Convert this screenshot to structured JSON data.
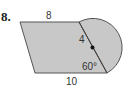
{
  "problem": {
    "number": "8.",
    "labels": {
      "top_side": "8",
      "bottom_side": "10",
      "radius": "4",
      "angle": "60°"
    }
  },
  "colors": {
    "fill": "#c8c8c8",
    "stroke": "#555555"
  }
}
